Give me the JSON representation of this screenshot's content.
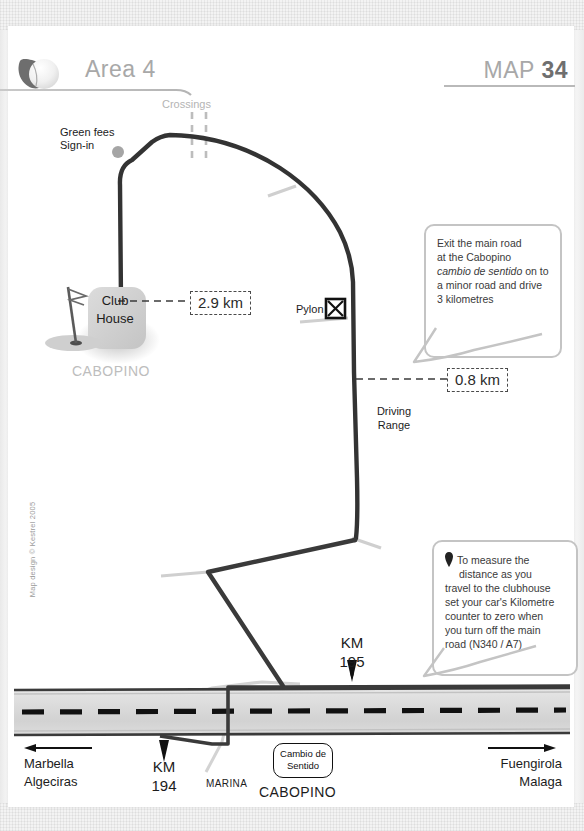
{
  "header": {
    "logo_icon": "golf-ball-icon",
    "area_label": "Area 4",
    "map_prefix": "MAP ",
    "map_number": "34"
  },
  "map": {
    "labels": {
      "green_fees": "Green fees\nSign-in",
      "green_fees_line1": "Green fees",
      "green_fees_line2": "Sign-in",
      "crossings": "Crossings",
      "club_house_line1": "Club",
      "club_house_line2": "House",
      "cabopino_course": "CABOPINO",
      "pylon": "Pylon",
      "driving_range_line1": "Driving",
      "driving_range_line2": "Range",
      "km195_line1": "KM",
      "km195_line2": "195",
      "km194_line1": "KM",
      "km194_line2": "194",
      "marina": "MARINA",
      "cabopino_junction": "CABOPINO",
      "cambio_line1": "Cambio de",
      "cambio_line2": "Sentido",
      "marbella_line1": "Marbella",
      "marbella_line2": "Algeciras",
      "fuengirola_line1": "Fuengirola",
      "fuengirola_line2": "Malaga"
    },
    "distances": {
      "clubhouse_to_main": "2.9 km",
      "pylon_to_main": "0.8 km"
    },
    "callouts": [
      {
        "id": "exit-instructions",
        "line1": "Exit the main road",
        "line2": "at the Cabopino",
        "italic": "cambio de sentido",
        "line3_tail": " on to",
        "line4": "a minor road and drive",
        "line5": "3 kilometres"
      },
      {
        "id": "measure-instructions",
        "marker_icon": "map-pin-icon",
        "line1": "To measure the",
        "line2": "distance as you",
        "line3": "travel to the clubhouse",
        "line4": "set your car's Kilometre",
        "line5": "counter to zero when",
        "line6": "you turn off the main",
        "line7": "road (N340 / A7)"
      }
    ],
    "colors": {
      "road_dark": "#333333",
      "highway_fill": "#d8d8d8",
      "minor_road": "#c9c9c9",
      "header_grey": "#a8a8a8",
      "text_dark": "#1c1c1c",
      "clubhouse_fill": "#d2d2d2"
    }
  },
  "footer": {
    "copyright": "Map design © Kestrel 2005"
  }
}
